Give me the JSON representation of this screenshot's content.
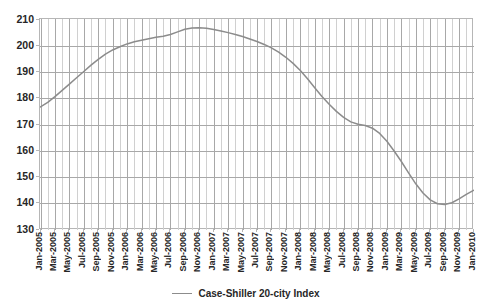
{
  "chart_data": {
    "type": "line",
    "title": "",
    "xlabel": "",
    "ylabel": "",
    "ylim": [
      130,
      210
    ],
    "ytick_step": 10,
    "yticks": [
      210,
      200,
      190,
      180,
      170,
      160,
      150,
      140,
      130
    ],
    "grid": true,
    "grid_major_axis": "y",
    "grid_minor_axis": "x",
    "legend_position": "bottom-center",
    "series": [
      {
        "name": "Case-Shiller 20-city Index",
        "color": "#8c8c8c",
        "x": [
          "Jan-2005",
          "Feb-2005",
          "Mar-2005",
          "Apr-2005",
          "May-2005",
          "Jun-2005",
          "Jul-2005",
          "Aug-2005",
          "Sep-2005",
          "Oct-2005",
          "Nov-2005",
          "Dec-2005",
          "Jan-2006",
          "Feb-2006",
          "Mar-2006",
          "Apr-2006",
          "May-2006",
          "Jun-2006",
          "Jul-2006",
          "Aug-2006",
          "Sep-2006",
          "Oct-2006",
          "Nov-2006",
          "Dec-2006",
          "Jan-2007",
          "Feb-2007",
          "Mar-2007",
          "Apr-2007",
          "May-2007",
          "Jun-2007",
          "Jul-2007",
          "Aug-2007",
          "Sep-2007",
          "Oct-2007",
          "Nov-2007",
          "Dec-2007",
          "Jan-2008",
          "Feb-2008",
          "Mar-2008",
          "Apr-2008",
          "May-2008",
          "Jun-2008",
          "Jul-2008",
          "Aug-2008",
          "Sep-2008",
          "Oct-2008",
          "Nov-2008",
          "Dec-2008",
          "Jan-2009",
          "Feb-2009",
          "Mar-2009",
          "Apr-2009",
          "May-2009",
          "Jun-2009",
          "Jul-2009",
          "Aug-2009",
          "Sep-2009",
          "Oct-2009",
          "Nov-2009",
          "Dec-2009",
          "Jan-2010"
        ],
        "values": [
          176.7,
          178.4,
          180.6,
          183.0,
          185.4,
          187.8,
          190.2,
          192.6,
          194.8,
          196.8,
          198.4,
          199.6,
          200.7,
          201.5,
          202.1,
          202.7,
          203.2,
          203.6,
          204.3,
          205.3,
          206.3,
          206.8,
          206.9,
          206.7,
          206.2,
          205.6,
          205.0,
          204.3,
          203.5,
          202.6,
          201.6,
          200.5,
          199.2,
          197.6,
          195.6,
          193.3,
          190.6,
          187.4,
          184.0,
          180.7,
          177.7,
          175.0,
          172.7,
          171.0,
          170.1,
          169.6,
          168.6,
          166.6,
          163.6,
          159.9,
          155.9,
          151.6,
          147.4,
          143.9,
          141.3,
          139.8,
          139.5,
          140.2,
          141.7,
          143.4,
          144.9
        ]
      }
    ],
    "xtick_labels": [
      "Jan-2005",
      "Mar-2005",
      "May-2005",
      "Jul-2005",
      "Sep-2005",
      "Nov-2005",
      "Jan-2006",
      "Mar-2006",
      "May-2006",
      "Jul-2006",
      "Sep-2006",
      "Nov-2006",
      "Jan-2007",
      "Mar-2007",
      "May-2007",
      "Jul-2007",
      "Sep-2007",
      "Nov-2007",
      "Jan-2008",
      "Mar-2008",
      "May-2008",
      "Jul-2008",
      "Sep-2008",
      "Nov-2008",
      "Jan-2009",
      "Mar-2009",
      "May-2009",
      "Jul-2009",
      "Sep-2009",
      "Nov-2009",
      "Jan-2010"
    ]
  },
  "legend": {
    "entries": [
      {
        "label": "Case-Shiller 20-city Index",
        "color": "#8c8c8c"
      }
    ]
  },
  "colors": {
    "line": "#8c8c8c",
    "grid_major": "#a8a8a8",
    "grid_minor": "#d0d0d0",
    "frame": "#b6b6b6",
    "text": "#262626",
    "background": "#ffffff"
  }
}
